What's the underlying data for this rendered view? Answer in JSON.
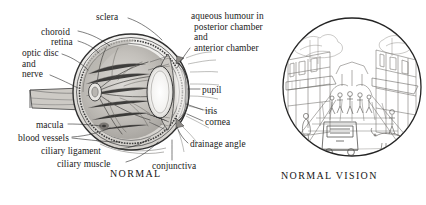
{
  "figure": {
    "background_color": "#ffffff",
    "ink_color": "#1b1b1b"
  },
  "left_panel": {
    "caption": "NORMAL",
    "subject": "cutaway cross-section of the human eyeball with optic nerve stub",
    "labels": [
      {
        "id": "sclera",
        "text": "sclera"
      },
      {
        "id": "choroid",
        "text": "choroid"
      },
      {
        "id": "retina",
        "text": "retina"
      },
      {
        "id": "optic-disc",
        "text": "optic disc"
      },
      {
        "id": "and-1",
        "text": "and"
      },
      {
        "id": "nerve",
        "text": "nerve"
      },
      {
        "id": "macula",
        "text": "macula"
      },
      {
        "id": "blood-vessels",
        "text": "blood vessels"
      },
      {
        "id": "ciliary-ligament",
        "text": "ciliary ligament"
      },
      {
        "id": "ciliary-muscle",
        "text": "ciliary muscle"
      },
      {
        "id": "conjunctiva",
        "text": "conjunctiva"
      }
    ]
  },
  "center_labels": {
    "aqueous_line_1": "aqueous humour in",
    "aqueous_line_2": "posterior chamber",
    "aqueous_line_3": "and",
    "aqueous_line_4": "anterior chamber",
    "pupil": "pupil",
    "iris": "iris",
    "cornea": "cornea",
    "drainage_angle": "drainage angle"
  },
  "right_panel": {
    "caption": "NORMAL VISION",
    "subject": "circular street scene viewed with normal vision: shop fronts, awnings, pedestrians on a pavement, a parked van and a dog"
  }
}
